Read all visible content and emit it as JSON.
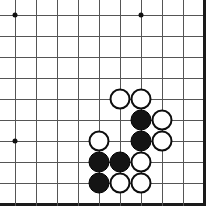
{
  "board": {
    "title": "Go board position",
    "type": "go-goban",
    "visible_columns": 10,
    "visible_rows": 10,
    "cell_size": 21,
    "origin_x": 15,
    "origin_y": 15,
    "line_color": "#555555",
    "edge_color": "#1a1a1a",
    "background_color": "#ffffff",
    "black_stone_color": "#141414",
    "white_stone_color": "#ffffff",
    "white_stone_border_color": "#0d0d0d",
    "edges": {
      "top": false,
      "left": false,
      "right": true,
      "bottom": true
    },
    "star_points": [
      {
        "col": 0,
        "row": 0
      },
      {
        "col": 6,
        "row": 0
      },
      {
        "col": 0,
        "row": 6
      }
    ],
    "stones": [
      {
        "col": 5,
        "row": 4,
        "color": "white"
      },
      {
        "col": 6,
        "row": 4,
        "color": "white"
      },
      {
        "col": 6,
        "row": 5,
        "color": "black"
      },
      {
        "col": 7,
        "row": 5,
        "color": "white"
      },
      {
        "col": 4,
        "row": 6,
        "color": "white"
      },
      {
        "col": 6,
        "row": 6,
        "color": "black"
      },
      {
        "col": 7,
        "row": 6,
        "color": "white"
      },
      {
        "col": 4,
        "row": 7,
        "color": "black"
      },
      {
        "col": 5,
        "row": 7,
        "color": "black"
      },
      {
        "col": 6,
        "row": 7,
        "color": "white"
      },
      {
        "col": 4,
        "row": 8,
        "color": "black"
      },
      {
        "col": 5,
        "row": 8,
        "color": "white"
      },
      {
        "col": 6,
        "row": 8,
        "color": "white"
      }
    ],
    "stone_counts": {
      "black": 5,
      "white": 8
    }
  }
}
